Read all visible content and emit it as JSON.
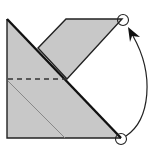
{
  "diagram": {
    "type": "origami-fold-step",
    "description": "Valley fold: bring bottom-right corner up to top-right circled point",
    "colors": {
      "paper": "#c8c8c8",
      "paper_light": "#d4d4d4",
      "edge": "#222222",
      "crease_thin": "#888888",
      "background": "#ffffff"
    },
    "elements": {
      "base_shape": "left square-ish paper with diagonal edge",
      "upper_flap": "flap above diagonal",
      "fold_line": "dashed valley fold line",
      "crease": "thin existing crease line",
      "circle_start": "bottom circled corner",
      "circle_end": "top circled corner",
      "arrow": "curved fold arrow from bottom to top"
    }
  }
}
